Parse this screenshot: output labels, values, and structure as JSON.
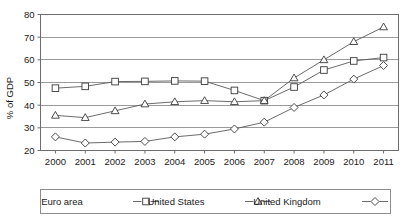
{
  "chart_data": {
    "type": "line",
    "title": "",
    "subtitle": "",
    "xlabel": "",
    "ylabel": "% of GDP",
    "x": [
      2000,
      2001,
      2002,
      2003,
      2004,
      2005,
      2006,
      2007,
      2008,
      2009,
      2010,
      2011
    ],
    "xticklabels": [
      "2000",
      "2001",
      "2002",
      "2003",
      "2004",
      "2005",
      "2006",
      "2007",
      "2008",
      "2009",
      "2010",
      "2011"
    ],
    "yticks": [
      20,
      30,
      40,
      50,
      60,
      70,
      80
    ],
    "yticklabels": [
      "20",
      "30",
      "40",
      "50",
      "60",
      "70",
      "80"
    ],
    "ylim": [
      20,
      80
    ],
    "grid": "horizontal",
    "legend_position": "bottom-outside",
    "series": [
      {
        "name": "Euro area",
        "marker": "square",
        "values": [
          47.5,
          48.3,
          50.4,
          50.5,
          50.7,
          50.6,
          46.5,
          42.0,
          48.0,
          55.5,
          59.5,
          61.0
        ]
      },
      {
        "name": "United States",
        "marker": "triangle",
        "values": [
          35.5,
          34.5,
          37.5,
          40.5,
          41.5,
          42.0,
          41.5,
          42.0,
          52.0,
          60.0,
          68.0,
          74.5
        ]
      },
      {
        "name": "United Kingdom",
        "marker": "diamond",
        "values": [
          26.0,
          23.3,
          23.7,
          24.0,
          26.0,
          27.2,
          29.5,
          32.5,
          39.0,
          44.5,
          51.5,
          57.5
        ]
      }
    ],
    "colors": {
      "line": "#5a5a5a",
      "marker_fill": "#ffffff",
      "marker_stroke": "#3a3a3a",
      "gridline": "#9a9a9a",
      "frame": "#6d6d6d",
      "text": "#1a1a1a",
      "background": "#ffffff"
    }
  },
  "legend": {
    "items": [
      {
        "label": "Euro area",
        "marker": "square"
      },
      {
        "label": "United States",
        "marker": "triangle"
      },
      {
        "label": "United Kingdom",
        "marker": "diamond"
      }
    ]
  }
}
